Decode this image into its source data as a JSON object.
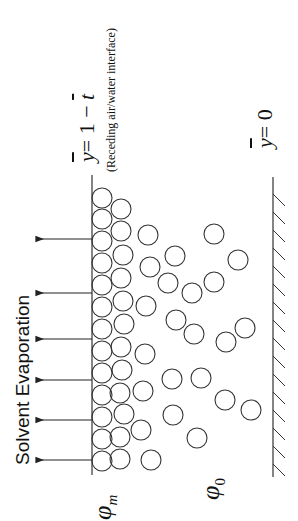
{
  "diagram": {
    "orientation": "rotated-90-ccw",
    "title": "Solvent Evaporation",
    "interface_equation": "y = 1 − t",
    "interface_equation_parts": {
      "lhs": "y",
      "rhs_prefix": "= 1 − ",
      "rhs_var": "t"
    },
    "interface_caption": "(Receding air/water interface)",
    "substrate_equation": "y = 0",
    "substrate_equation_parts": {
      "lhs": "y",
      "rhs": "= 0"
    },
    "phi_m_label": {
      "symbol": "φ",
      "subscript": "m"
    },
    "phi_0_label": {
      "symbol": "φ",
      "subscript": "0"
    },
    "arrow_count": 6,
    "colors": {
      "stroke": "#333333",
      "text": "#111111",
      "background": "#ffffff"
    }
  }
}
